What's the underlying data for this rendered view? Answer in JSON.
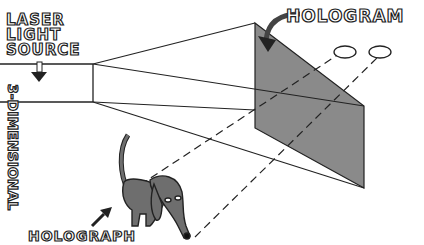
{
  "labels": {
    "laser_line1": "LASER",
    "laser_line2": "LIGHT",
    "laser_line3": "SOURCE",
    "hologram": "HOLOGRAM",
    "dimensional": "3-DIMENSIONAL",
    "holograph": "HOLOGRAPH"
  },
  "colors": {
    "line": "#222222",
    "hologram_fill": "#8a8a8a",
    "dog_fill": "#6e6e6e"
  }
}
